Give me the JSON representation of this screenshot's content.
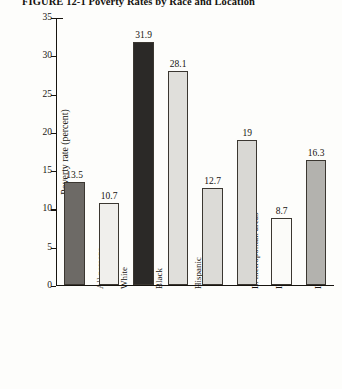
{
  "figure": {
    "number": "FIGURE 12-1",
    "title": "Poverty Rates by Race and Location",
    "full_title": "FIGURE 12-1  Poverty Rates by Race and Location"
  },
  "chart_data": {
    "type": "bar",
    "title": "Poverty Rates by Race and Location",
    "xlabel": "",
    "ylabel": "Poverty rate (percent)",
    "ylim": [
      0,
      35
    ],
    "ytick_step": 5,
    "yticks": [
      "0",
      "5",
      "10",
      "15",
      "20",
      "25",
      "30",
      "35"
    ],
    "grid": false,
    "legend": false,
    "categories": [
      "All persons",
      "White",
      "Black",
      "Hispanic",
      "In metropolitan areas",
      "In central cities",
      "In suburban rings",
      "Outside metropolitan areas"
    ],
    "values": [
      13.5,
      10.7,
      31.9,
      28.1,
      12.7,
      19,
      8.7,
      16.3
    ],
    "value_labels": [
      "13.5",
      "10.7",
      "31.9",
      "28.1",
      "12.7",
      "19",
      "8.7",
      "16.3"
    ],
    "bar_colors": [
      "#6d6a66",
      "#f0efec",
      "#2b2927",
      "#e0dfdb",
      "#dcdbd7",
      "#d9d8d4",
      "#fbfbf9",
      "#b3b2ae"
    ]
  },
  "axes": {
    "y_title": "Poverty rate (percent)",
    "y_max": 35
  }
}
